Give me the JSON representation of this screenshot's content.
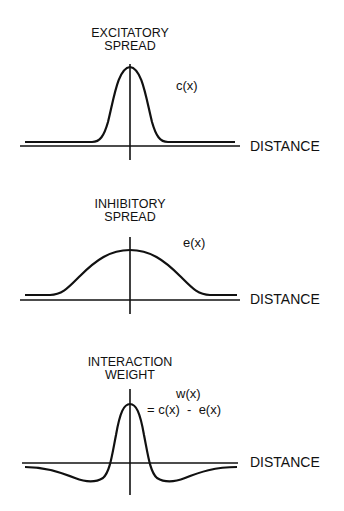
{
  "panels": [
    {
      "title_line1": "EXCITATORY",
      "title_line2": "SPREAD",
      "function_label": "c(x)",
      "axis_label": "DISTANCE"
    },
    {
      "title_line1": "INHIBITORY",
      "title_line2": "SPREAD",
      "function_label": "e(x)",
      "axis_label": "DISTANCE"
    },
    {
      "title_line1": "INTERACTION",
      "title_line2": "WEIGHT",
      "function_label": "w(x)",
      "function_formula": "= c(x)  -  e(x)",
      "axis_label": "DISTANCE"
    }
  ],
  "colors": {
    "ink": "#111111",
    "background": "#ffffff"
  }
}
